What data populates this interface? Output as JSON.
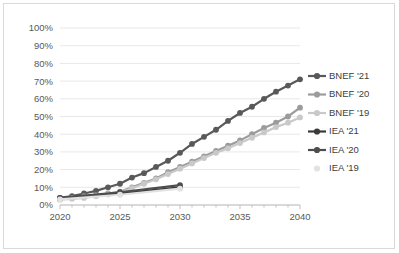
{
  "chart_data": {
    "type": "line",
    "title": "",
    "subtitle": "",
    "xlabel": "",
    "ylabel": "",
    "xlim": [
      2020,
      2040
    ],
    "ylim": [
      0,
      1.0
    ],
    "grid": true,
    "grid_axis": "y",
    "legend_position": "right",
    "y_tick_labels": [
      "100%",
      "90%",
      "80%",
      "70%",
      "60%",
      "50%",
      "40%",
      "30%",
      "20%",
      "10%",
      "0%"
    ],
    "y_tick_values": [
      1.0,
      0.9,
      0.8,
      0.7,
      0.6,
      0.5,
      0.4,
      0.3,
      0.2,
      0.1,
      0.0
    ],
    "x_tick_labels": [
      "2020",
      "2025",
      "2030",
      "2035",
      "2040"
    ],
    "x_tick_values": [
      2020,
      2025,
      2030,
      2035,
      2040
    ],
    "x_minor_ticks": [
      2021,
      2022,
      2023,
      2024,
      2026,
      2027,
      2028,
      2029,
      2031,
      2032,
      2033,
      2034,
      2036,
      2037,
      2038,
      2039
    ],
    "series": [
      {
        "name": "BNEF '21",
        "color": "#595959",
        "marker": "circle",
        "x": [
          2020,
          2021,
          2022,
          2023,
          2024,
          2025,
          2026,
          2027,
          2028,
          2029,
          2030,
          2031,
          2032,
          2033,
          2034,
          2035,
          2036,
          2037,
          2038,
          2039,
          2040
        ],
        "values": [
          0.04,
          0.05,
          0.065,
          0.08,
          0.1,
          0.12,
          0.155,
          0.18,
          0.215,
          0.25,
          0.295,
          0.345,
          0.385,
          0.425,
          0.475,
          0.52,
          0.555,
          0.6,
          0.64,
          0.675,
          0.71
        ]
      },
      {
        "name": "BNEF '20",
        "color": "#9c9c9c",
        "marker": "circle",
        "x": [
          2020,
          2021,
          2022,
          2023,
          2024,
          2025,
          2026,
          2027,
          2028,
          2029,
          2030,
          2031,
          2032,
          2033,
          2034,
          2035,
          2036,
          2037,
          2038,
          2039,
          2040
        ],
        "values": [
          0.035,
          0.04,
          0.05,
          0.055,
          0.065,
          0.075,
          0.1,
          0.125,
          0.15,
          0.185,
          0.215,
          0.245,
          0.275,
          0.305,
          0.335,
          0.365,
          0.4,
          0.435,
          0.465,
          0.5,
          0.55
        ]
      },
      {
        "name": "BNEF '19",
        "color": "#c9c9c9",
        "marker": "circle",
        "x": [
          2020,
          2021,
          2022,
          2023,
          2024,
          2025,
          2026,
          2027,
          2028,
          2029,
          2030,
          2031,
          2032,
          2033,
          2034,
          2035,
          2036,
          2037,
          2038,
          2039,
          2040
        ],
        "values": [
          0.03,
          0.035,
          0.04,
          0.05,
          0.06,
          0.07,
          0.095,
          0.12,
          0.145,
          0.175,
          0.205,
          0.235,
          0.265,
          0.295,
          0.32,
          0.35,
          0.38,
          0.41,
          0.44,
          0.465,
          0.495
        ]
      },
      {
        "name": "IEA '21",
        "color": "#3b3b3b",
        "marker": "circle",
        "x": [
          2020,
          2025,
          2030
        ],
        "values": [
          0.035,
          0.065,
          0.1
        ]
      },
      {
        "name": "IEA '20",
        "color": "#4d4d4d",
        "marker": "circle",
        "x": [
          2020,
          2025,
          2030
        ],
        "values": [
          0.04,
          0.072,
          0.112
        ]
      },
      {
        "name": "IEA '19",
        "color": "#e2e2e2",
        "marker": "circle",
        "x": [
          2020,
          2025,
          2030
        ],
        "values": [
          0.032,
          0.058,
          0.092
        ]
      }
    ]
  },
  "legend": {
    "items": [
      {
        "label": "BNEF '21",
        "color": "#595959",
        "show_line": true
      },
      {
        "label": "BNEF '20",
        "color": "#9c9c9c",
        "show_line": true
      },
      {
        "label": "BNEF '19",
        "color": "#c9c9c9",
        "show_line": true
      },
      {
        "label": "IEA '21",
        "color": "#3b3b3b",
        "show_line": true
      },
      {
        "label": "IEA '20",
        "color": "#4d4d4d",
        "show_line": true
      },
      {
        "label": "IEA '19",
        "color": "#e2e2e2",
        "show_line": false
      }
    ]
  },
  "colors": {
    "grid": "#e8e8e8",
    "axis": "#bfbfbf",
    "frame": "#d9d9d9",
    "tick_text": "#595959",
    "legend_text": "#404040",
    "background": "#ffffff"
  }
}
